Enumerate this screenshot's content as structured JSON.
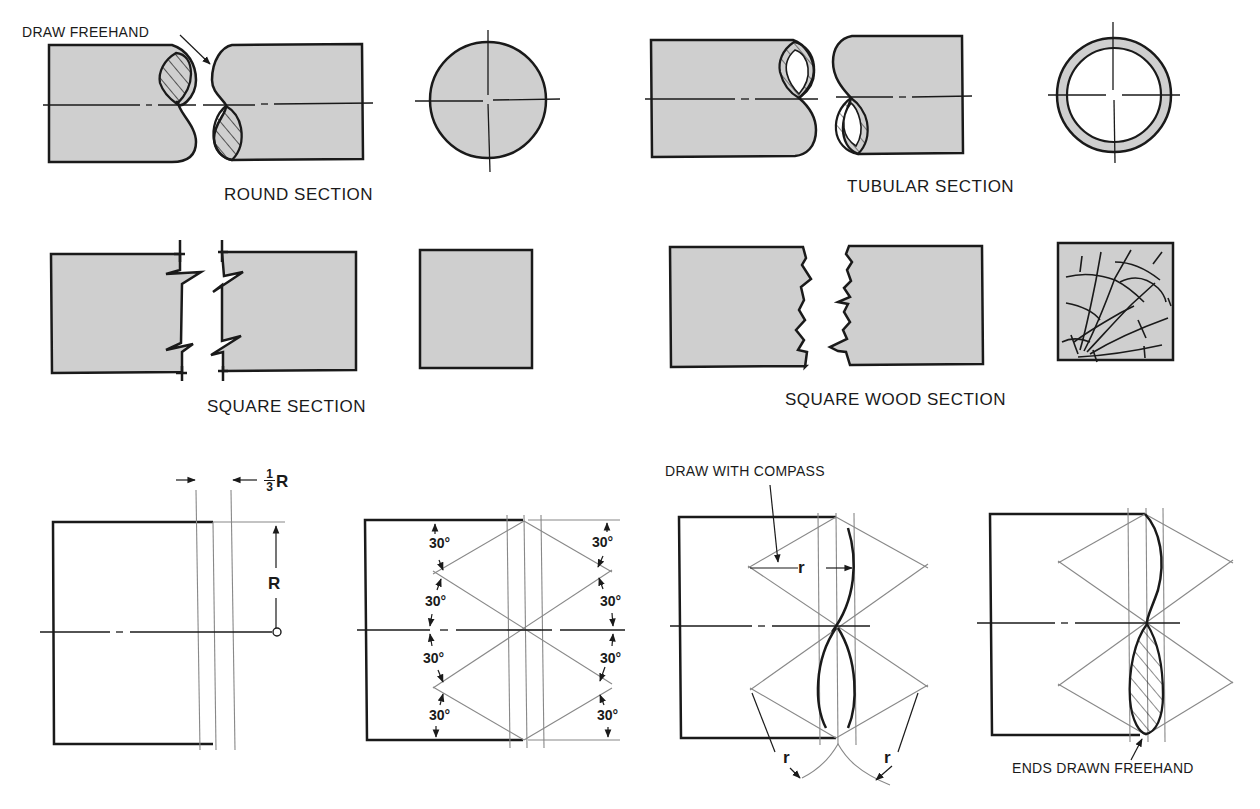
{
  "colors": {
    "ink": "#1a1a1a",
    "section_fill": "#cfcfcf",
    "construction_line": "#888888",
    "background": "#ffffff"
  },
  "figures": {
    "round_section": {
      "caption": "ROUND SECTION",
      "callout": "DRAW FREEHAND"
    },
    "tubular_section": {
      "caption": "TUBULAR SECTION"
    },
    "square_section": {
      "caption": "SQUARE SECTION"
    },
    "square_wood_section": {
      "caption": "SQUARE WOOD SECTION"
    },
    "construction_step_1": {
      "offset_label_num": "1",
      "offset_label_den": "3",
      "offset_label_suffix": "R",
      "radius_label": "R"
    },
    "construction_step_2": {
      "angle_labels_left": [
        "30°",
        "30°",
        "30°",
        "30°"
      ],
      "angle_labels_right": [
        "30°",
        "30°",
        "30°",
        "30°"
      ]
    },
    "construction_step_3": {
      "callout": "DRAW WITH COMPASS",
      "radius_labels": [
        "r",
        "r",
        "r"
      ]
    },
    "construction_step_4": {
      "callout": "ENDS DRAWN FREEHAND"
    }
  }
}
